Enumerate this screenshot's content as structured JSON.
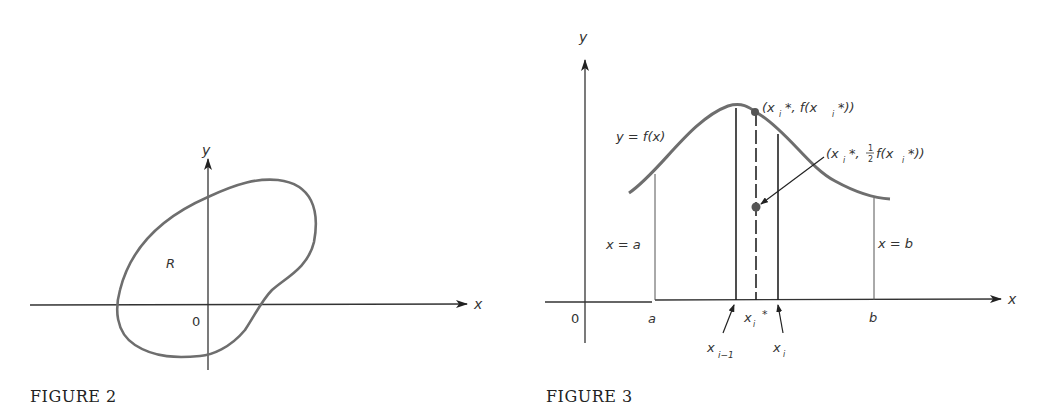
{
  "figure2": {
    "caption": "FIGURE 2",
    "x_axis_label": "x",
    "y_axis_label": "y",
    "origin_label": "0",
    "region_label": "R",
    "curve_color": "#6e6e6e"
  },
  "figure3": {
    "caption": "FIGURE 3",
    "x_axis_label": "x",
    "y_axis_label": "y",
    "origin_label": "0",
    "function_label": "y = f(x)",
    "left_bound_label": "x = a",
    "right_bound_label": "x = b",
    "tick_a": "a",
    "tick_b": "b",
    "tick_xi_star": "x",
    "tick_xi_star_sub": "i",
    "tick_xi_star_sup": "*",
    "tick_xi_minus_1": "x",
    "tick_xi_minus_1_sub": "i−1",
    "tick_xi": "x",
    "tick_xi_sub": "i",
    "point_top_label": "(x",
    "point_top_sub": "i",
    "point_top_rest": "*, f(x",
    "point_top_sub2": "i",
    "point_top_end": "*))",
    "point_mid_label": "(x",
    "point_mid_sub": "i",
    "point_mid_star": "*,",
    "point_mid_frac_num": "1",
    "point_mid_frac_den": "2",
    "point_mid_rest": "f(x",
    "point_mid_sub2": "i",
    "point_mid_end": "*))",
    "curve_color": "#6e6e6e"
  }
}
